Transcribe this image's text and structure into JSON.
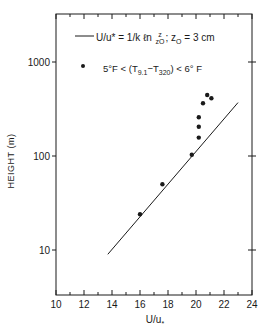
{
  "chart_data": {
    "type": "scatter",
    "title": "",
    "xlabel": "U/u*",
    "ylabel": "HEIGHT (m)",
    "xlim": [
      10,
      24
    ],
    "ylim": [
      3.3,
      3200
    ],
    "yscale": "log",
    "x_ticks": [
      10,
      12,
      14,
      16,
      18,
      20,
      22,
      24
    ],
    "y_ticks": [
      10,
      100,
      1000
    ],
    "grid": false,
    "legend_position": "upper left inside",
    "legend": [
      {
        "type": "line",
        "label": "U/u* = 1/k ln z/z0 ; z0 = 3 cm"
      },
      {
        "type": "marker",
        "label": "5°F < (T9.1 − T320) < 6°F"
      }
    ],
    "series": [
      {
        "name": "U/u* = 1/k ln(z/z0); z0 = 3 cm",
        "type": "line",
        "x": [
          13.7,
          23.0
        ],
        "y": [
          9,
          370
        ]
      },
      {
        "name": "5°F < (T9.1 − T320) < 6°F",
        "type": "scatter",
        "x": [
          16.0,
          17.6,
          19.7,
          20.2,
          20.2,
          20.2,
          20.5,
          20.8,
          21.1
        ],
        "y": [
          24,
          50,
          103,
          157,
          205,
          258,
          364,
          446,
          411
        ]
      }
    ]
  },
  "labels": {
    "ytitle": "HEIGHT (m)",
    "xtitle": "U/u",
    "xtitle_sub": "*",
    "x_ticks": [
      "10",
      "12",
      "14",
      "16",
      "18",
      "20",
      "22",
      "24"
    ],
    "y_ticks": [
      "10",
      "100",
      "1000"
    ],
    "legend1_a": "U/u",
    "legend1_b": "* = 1/k ℓn",
    "legend1_num": "z",
    "legend1_den": "zO",
    "legend1_c": "; z",
    "legend1_c_sub": "O",
    "legend1_d": "= 3  cm",
    "legend2_a": "5°F < (T",
    "legend2_sub1": "9.1",
    "legend2_b": "−T",
    "legend2_sub2": "320",
    "legend2_c": ") < 6° F"
  },
  "colors": {
    "ink": "#1a1a1a",
    "background": "#ffffff"
  }
}
